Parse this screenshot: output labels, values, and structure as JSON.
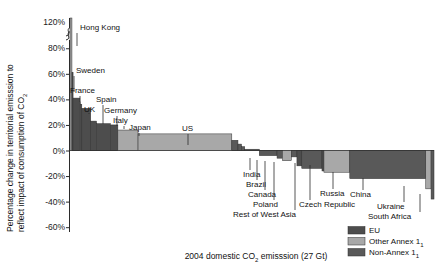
{
  "figure": {
    "background": "#ffffff",
    "y_axis_title_line1": "Percentage change in territorial emisssion to",
    "y_axis_title_line2": "reflect impact of consumption of CO",
    "y_axis_title_sub": "2",
    "x_axis_title_pre": "2004 domestic CO",
    "x_axis_title_sub": "2",
    "x_axis_title_post": " emisssion (27 Gt)",
    "axis_break_marker": "axis-break-squiggle"
  },
  "legend": {
    "position": "bottom-right",
    "items": [
      {
        "label": "EU",
        "sublabel": "",
        "color": "#4d4d4d"
      },
      {
        "label": "Other Annex 1",
        "sublabel": "1",
        "color": "#a8a8a8"
      },
      {
        "label": "Non-Annex 1",
        "sublabel": "1",
        "color": "#595959"
      }
    ]
  },
  "chart_data": {
    "type": "bar",
    "title": "",
    "subtitle": "",
    "xlabel": "2004 domestic CO2 emisssion (27 Gt)",
    "ylabel": "Percentage change in territorial emisssion to reflect impact of consumption of CO2",
    "ylim": [
      -60,
      120
    ],
    "yticks": [
      120,
      80,
      60,
      40,
      20,
      0,
      -20,
      -40,
      -60
    ],
    "ytick_labels": [
      "120%",
      "80%",
      "60%",
      "40%",
      "20%",
      "0%",
      "-20%",
      "-40%",
      "-60%"
    ],
    "grid": false,
    "axis_break": {
      "between": [
        80,
        120
      ],
      "note": "y-axis broken above 80%"
    },
    "x_is_cumulative_width": true,
    "x_total_gt": 27,
    "x_units": "Gt CO2 (2004 domestic emission)",
    "legend_position": "bottom-right",
    "bars": [
      {
        "name": "Hong Kong",
        "value": 118,
        "width_gt": 0.12,
        "group": "Other Annex 1",
        "labeled": true
      },
      {
        "name": "Sweden",
        "value": 61,
        "width_gt": 0.07,
        "group": "EU",
        "labeled": true
      },
      {
        "name": "France",
        "value": 41,
        "width_gt": 0.42,
        "group": "EU",
        "labeled": true
      },
      {
        "name": "Switzerland",
        "value": 38,
        "width_gt": 0.05,
        "group": "Other Annex 1",
        "labeled": false
      },
      {
        "name": "Austria",
        "value": 36,
        "width_gt": 0.07,
        "group": "EU",
        "labeled": false
      },
      {
        "name": "UK",
        "value": 33,
        "width_gt": 0.55,
        "group": "EU",
        "labeled": true
      },
      {
        "name": "Spain",
        "value": 23,
        "width_gt": 0.36,
        "group": "EU",
        "labeled": true
      },
      {
        "name": "Germany",
        "value": 21,
        "width_gt": 0.85,
        "group": "EU",
        "labeled": true
      },
      {
        "name": "Italy",
        "value": 20,
        "width_gt": 0.47,
        "group": "EU",
        "labeled": true
      },
      {
        "name": "Japan",
        "value": 16,
        "width_gt": 1.25,
        "group": "Other Annex 1",
        "labeled": true
      },
      {
        "name": "US",
        "value": 13,
        "width_gt": 5.8,
        "group": "Other Annex 1",
        "labeled": true
      },
      {
        "name": "Mexico",
        "value": 8,
        "width_gt": 0.38,
        "group": "Non-Annex 1",
        "labeled": false
      },
      {
        "name": "Turkey",
        "value": 5,
        "width_gt": 0.22,
        "group": "Non-Annex 1",
        "labeled": false
      },
      {
        "name": "Thailand",
        "value": 3,
        "width_gt": 0.2,
        "group": "Non-Annex 1",
        "labeled": false
      },
      {
        "name": "Rest of World",
        "value": 1,
        "width_gt": 0.9,
        "group": "Non-Annex 1",
        "labeled": false
      },
      {
        "name": "India",
        "value": -4,
        "width_gt": 1.1,
        "group": "Non-Annex 1",
        "labeled": true
      },
      {
        "name": "Brazil",
        "value": -6,
        "width_gt": 0.33,
        "group": "Non-Annex 1",
        "labeled": true
      },
      {
        "name": "Canada",
        "value": -8,
        "width_gt": 0.55,
        "group": "Other Annex 1",
        "labeled": true
      },
      {
        "name": "Indonesia",
        "value": -5,
        "width_gt": 0.35,
        "group": "Non-Annex 1",
        "labeled": false
      },
      {
        "name": "Poland",
        "value": -12,
        "width_gt": 0.3,
        "group": "EU",
        "labeled": true
      },
      {
        "name": "Rest of West Asia",
        "value": -14,
        "width_gt": 1.25,
        "group": "Non-Annex 1",
        "labeled": true
      },
      {
        "name": "Czech Republic",
        "value": -16,
        "width_gt": 0.12,
        "group": "EU",
        "labeled": true
      },
      {
        "name": "Russia",
        "value": -17,
        "width_gt": 1.6,
        "group": "Other Annex 1",
        "labeled": true
      },
      {
        "name": "China",
        "value": -22,
        "width_gt": 4.7,
        "group": "Non-Annex 1",
        "labeled": true
      },
      {
        "name": "Ukraine",
        "value": -30,
        "width_gt": 0.33,
        "group": "Other Annex 1",
        "labeled": true
      },
      {
        "name": "South Africa",
        "value": -38,
        "width_gt": 0.18,
        "group": "Non-Annex 1",
        "labeled": true
      }
    ],
    "annotations": [
      {
        "text": "Hong Kong",
        "side": "above"
      },
      {
        "text": "Sweden",
        "side": "above"
      },
      {
        "text": "France",
        "side": "above"
      },
      {
        "text": "UK",
        "side": "above"
      },
      {
        "text": "Spain",
        "side": "above"
      },
      {
        "text": "Germany",
        "side": "above"
      },
      {
        "text": "Italy",
        "side": "above"
      },
      {
        "text": "Japan",
        "side": "above"
      },
      {
        "text": "US",
        "side": "above"
      },
      {
        "text": "India",
        "side": "below"
      },
      {
        "text": "Brazil",
        "side": "below"
      },
      {
        "text": "Canada",
        "side": "below"
      },
      {
        "text": "Poland",
        "side": "below"
      },
      {
        "text": "Rest of West Asia",
        "side": "below"
      },
      {
        "text": "Czech Republic",
        "side": "below"
      },
      {
        "text": "Russia",
        "side": "below"
      },
      {
        "text": "China",
        "side": "below"
      },
      {
        "text": "Ukraine",
        "side": "below"
      },
      {
        "text": "South Africa",
        "side": "below"
      }
    ]
  }
}
